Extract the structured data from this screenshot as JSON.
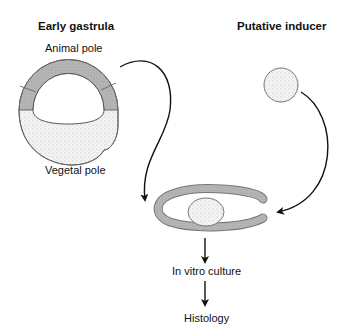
{
  "left_panel": {
    "heading": "Early gastrula",
    "top_label": "Animal pole",
    "bottom_label": "Vegetal pole"
  },
  "right_panel": {
    "heading": "Putative inducer"
  },
  "steps": [
    {
      "label": "In vitro culture"
    },
    {
      "label": "Histology"
    }
  ],
  "colors": {
    "animal_cap_fill": "#b8b8b8",
    "vegetal_fill": "#f2f2f2",
    "inducer_fill": "#e8e8e8",
    "outline": "#555555",
    "arrow": "#111111"
  }
}
